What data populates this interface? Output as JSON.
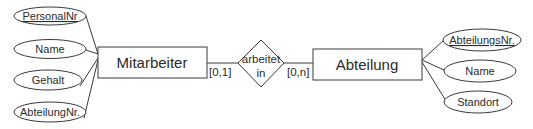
{
  "diagram": {
    "type": "entity-relationship",
    "entities": [
      {
        "name": "Mitarbeiter",
        "attributes": [
          {
            "label": "PersonalNr",
            "key": true
          },
          {
            "label": "Name",
            "key": false
          },
          {
            "label": "Gehalt",
            "key": false
          },
          {
            "label": "AbteilungNr.",
            "key": false
          }
        ]
      },
      {
        "name": "Abteilung",
        "attributes": [
          {
            "label": "AbteilungsNr.",
            "key": true
          },
          {
            "label": "Name",
            "key": false
          },
          {
            "label": "Standort",
            "key": false
          }
        ]
      }
    ],
    "relationship": {
      "line1": "arbeitet",
      "line2": "in",
      "cardinality_left": "[0,1]",
      "cardinality_right": "[0,n]"
    },
    "colors": {
      "stroke": "#3a3a3a",
      "text": "#2b2b2b",
      "background": "#ffffff"
    }
  }
}
